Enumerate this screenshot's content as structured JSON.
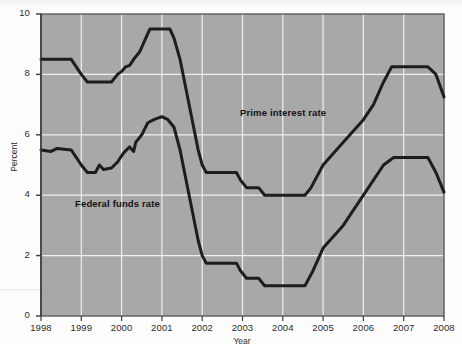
{
  "chart_data": {
    "type": "line",
    "title": "",
    "xlabel": "Year",
    "ylabel": "Percent",
    "xlim": [
      1998,
      2008
    ],
    "ylim": [
      0,
      10
    ],
    "xticks": [
      "1998",
      "1999",
      "2000",
      "2001",
      "2002",
      "2003",
      "2004",
      "2005",
      "2006",
      "2007",
      "2008"
    ],
    "yticks": [
      "0",
      "2",
      "4",
      "6",
      "8",
      "10"
    ],
    "grid": true,
    "legend_position": "inline-annotation",
    "plot_background_color": "#a8a8a8",
    "gridline_color": "#efefef",
    "line_color": "#1d1d1d",
    "series": [
      {
        "name": "Prime interest rate",
        "label_x": 2005.0,
        "label_y": 7.0,
        "points": [
          [
            1998.0,
            8.5
          ],
          [
            1998.75,
            8.5
          ],
          [
            1999.0,
            8.0
          ],
          [
            1999.15,
            7.75
          ],
          [
            1999.75,
            7.75
          ],
          [
            1999.9,
            8.0
          ],
          [
            2000.0,
            8.1
          ],
          [
            2000.1,
            8.25
          ],
          [
            2000.2,
            8.3
          ],
          [
            2000.3,
            8.5
          ],
          [
            2000.45,
            8.75
          ],
          [
            2000.6,
            9.2
          ],
          [
            2000.7,
            9.5
          ],
          [
            2001.2,
            9.5
          ],
          [
            2001.3,
            9.2
          ],
          [
            2001.45,
            8.5
          ],
          [
            2001.6,
            7.5
          ],
          [
            2001.75,
            6.5
          ],
          [
            2001.9,
            5.5
          ],
          [
            2002.0,
            5.0
          ],
          [
            2002.1,
            4.75
          ],
          [
            2002.85,
            4.75
          ],
          [
            2002.95,
            4.5
          ],
          [
            2003.1,
            4.25
          ],
          [
            2003.4,
            4.25
          ],
          [
            2003.55,
            4.0
          ],
          [
            2004.55,
            4.0
          ],
          [
            2004.7,
            4.25
          ],
          [
            2005.0,
            5.0
          ],
          [
            2005.5,
            5.75
          ],
          [
            2006.0,
            6.5
          ],
          [
            2006.25,
            7.0
          ],
          [
            2006.5,
            7.75
          ],
          [
            2006.7,
            8.25
          ],
          [
            2007.6,
            8.25
          ],
          [
            2007.8,
            8.0
          ],
          [
            2008.0,
            7.25
          ]
        ]
      },
      {
        "name": "Federal funds rate",
        "label_x": 1999.3,
        "label_y": 3.6,
        "points": [
          [
            1998.0,
            5.5
          ],
          [
            1998.25,
            5.45
          ],
          [
            1998.4,
            5.55
          ],
          [
            1998.75,
            5.5
          ],
          [
            1999.0,
            5.0
          ],
          [
            1999.15,
            4.75
          ],
          [
            1999.35,
            4.75
          ],
          [
            1999.45,
            5.0
          ],
          [
            1999.55,
            4.85
          ],
          [
            1999.75,
            4.9
          ],
          [
            1999.9,
            5.1
          ],
          [
            2000.05,
            5.4
          ],
          [
            2000.2,
            5.6
          ],
          [
            2000.3,
            5.45
          ],
          [
            2000.35,
            5.75
          ],
          [
            2000.5,
            6.0
          ],
          [
            2000.65,
            6.4
          ],
          [
            2000.8,
            6.5
          ],
          [
            2001.0,
            6.6
          ],
          [
            2001.15,
            6.5
          ],
          [
            2001.3,
            6.25
          ],
          [
            2001.45,
            5.5
          ],
          [
            2001.6,
            4.5
          ],
          [
            2001.75,
            3.5
          ],
          [
            2001.9,
            2.5
          ],
          [
            2002.0,
            2.0
          ],
          [
            2002.1,
            1.75
          ],
          [
            2002.85,
            1.75
          ],
          [
            2002.95,
            1.5
          ],
          [
            2003.1,
            1.25
          ],
          [
            2003.4,
            1.25
          ],
          [
            2003.55,
            1.0
          ],
          [
            2004.55,
            1.0
          ],
          [
            2004.75,
            1.5
          ],
          [
            2005.0,
            2.25
          ],
          [
            2005.5,
            3.0
          ],
          [
            2006.0,
            4.0
          ],
          [
            2006.25,
            4.5
          ],
          [
            2006.5,
            5.0
          ],
          [
            2006.75,
            5.25
          ],
          [
            2007.6,
            5.25
          ],
          [
            2007.8,
            4.75
          ],
          [
            2008.0,
            4.1
          ]
        ]
      }
    ]
  }
}
